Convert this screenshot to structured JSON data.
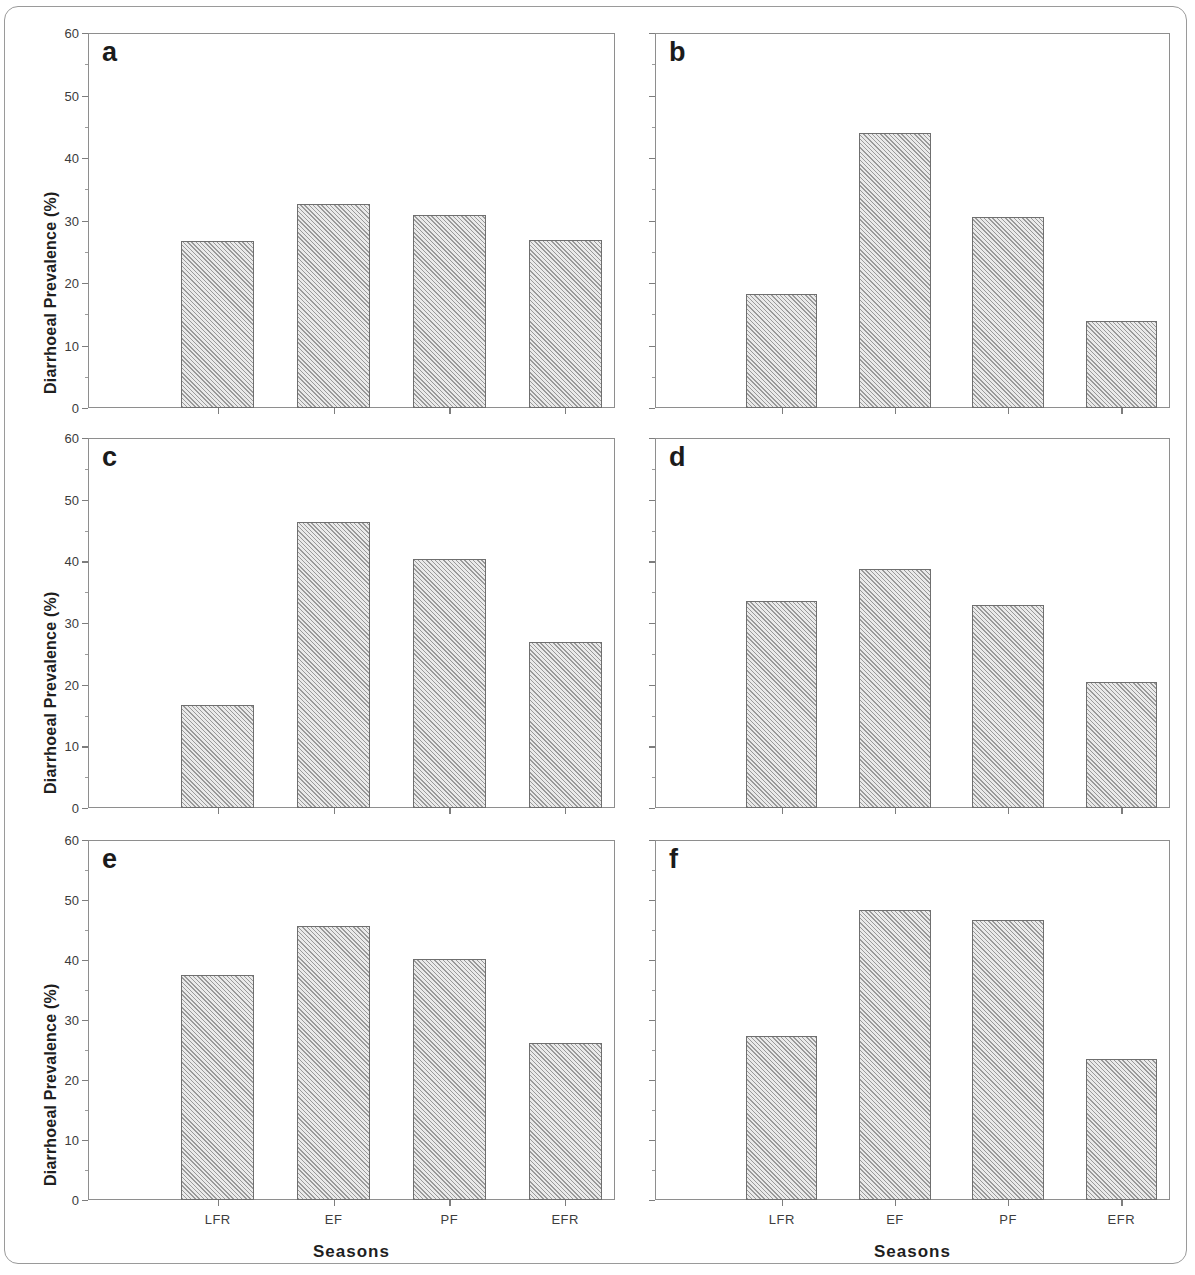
{
  "figure": {
    "y_axis_title": "Diarrhoeal Prevalence (%)",
    "x_axis_title": "Seasons",
    "panel_letters": [
      "a",
      "b",
      "c",
      "d",
      "e",
      "f"
    ],
    "categories": [
      "LFR",
      "EF",
      "PF",
      "EFR"
    ],
    "y_ticks": [
      "0",
      "10",
      "20",
      "30",
      "40",
      "50",
      "60"
    ],
    "bar_fill_color": "#c3c3c3",
    "bar_border_color": "#6f6f6f",
    "axis_color": "#8e8e8e",
    "frame_color": "#9a9a9a"
  },
  "chart_data": {
    "type": "bar",
    "title": "",
    "xlabel": "Seasons",
    "ylabel": "Diarrhoeal Prevalence (%)",
    "ylim": [
      0,
      60
    ],
    "ytick_values": [
      0,
      10,
      20,
      30,
      40,
      50,
      60
    ],
    "grid": false,
    "legend": "none",
    "categories": [
      "LFR",
      "EF",
      "PF",
      "EFR"
    ],
    "panels": [
      {
        "letter": "a",
        "values": [
          26.8,
          32.6,
          30.9,
          26.9
        ],
        "show_y_tick_labels": true,
        "show_y_axis_title": true,
        "show_x_tick_labels": false,
        "show_x_axis_title": false
      },
      {
        "letter": "b",
        "values": [
          18.3,
          44.0,
          30.5,
          13.9
        ],
        "show_y_tick_labels": false,
        "show_y_axis_title": false,
        "show_x_tick_labels": false,
        "show_x_axis_title": false
      },
      {
        "letter": "c",
        "values": [
          16.7,
          46.3,
          40.3,
          26.9
        ],
        "show_y_tick_labels": true,
        "show_y_axis_title": true,
        "show_x_tick_labels": false,
        "show_x_axis_title": false
      },
      {
        "letter": "d",
        "values": [
          33.5,
          38.7,
          32.9,
          20.5
        ],
        "show_y_tick_labels": false,
        "show_y_axis_title": false,
        "show_x_tick_labels": false,
        "show_x_axis_title": false
      },
      {
        "letter": "e",
        "values": [
          37.5,
          45.7,
          40.2,
          26.2
        ],
        "show_y_tick_labels": true,
        "show_y_axis_title": true,
        "show_x_tick_labels": true,
        "show_x_axis_title": true
      },
      {
        "letter": "f",
        "values": [
          27.3,
          48.3,
          46.7,
          23.5
        ],
        "show_y_tick_labels": false,
        "show_y_axis_title": false,
        "show_x_tick_labels": true,
        "show_x_axis_title": true
      }
    ]
  }
}
